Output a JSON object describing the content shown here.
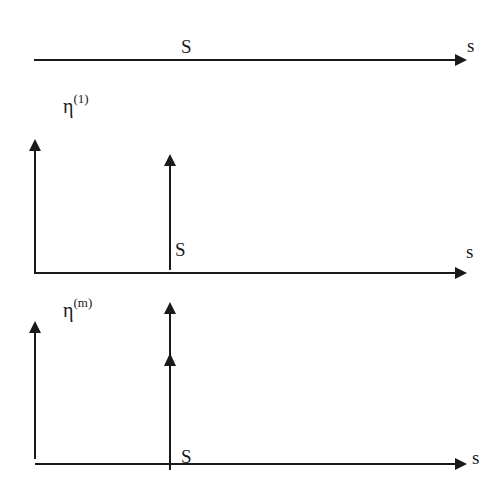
{
  "diagram": {
    "type": "arrow-impulse-schematic",
    "panels": [
      {
        "id": "panel-1",
        "axis_label": "s",
        "marker_label": "S",
        "eta_label": null,
        "impulses": []
      },
      {
        "id": "panel-2",
        "axis_label": "s",
        "marker_label": "S",
        "eta_label": {
          "base": "η",
          "sup": "(1)"
        },
        "impulses": [
          {
            "position": "origin",
            "arrowheads": 1
          },
          {
            "position": "S",
            "arrowheads": 1
          }
        ]
      },
      {
        "id": "panel-3",
        "axis_label": "s",
        "marker_label": "S",
        "eta_label": {
          "base": "η",
          "sup": "(m)"
        },
        "impulses": [
          {
            "position": "origin",
            "arrowheads": 1
          },
          {
            "position": "S",
            "arrowheads": 2
          }
        ]
      }
    ],
    "colors": {
      "stroke": "#1a1a1a",
      "background": "#ffffff"
    }
  }
}
